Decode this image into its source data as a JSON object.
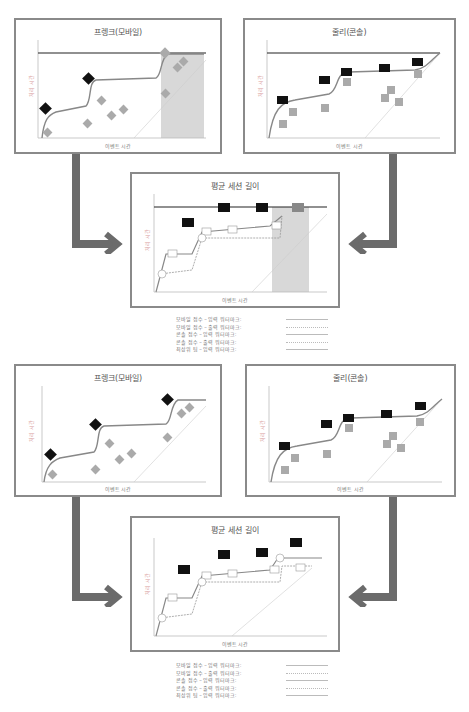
{
  "colors": {
    "panel_border": "#8a8a8a",
    "arrow": "#6b6b6b",
    "line": "#888888",
    "black_marker": "#111111",
    "grey_marker": "#9a9a9a",
    "shade": "#d8d8d8",
    "watermark": "#333333"
  },
  "sections": [
    {
      "mobile": {
        "title": "프렝크(모바일)",
        "xlabel": "이벤트 시간",
        "ylabel": "처리 시간",
        "markers_black": [
          "1.0",
          "1.2",
          "2.0"
        ],
        "markers_grey": [
          "1",
          "2",
          "3",
          "4",
          "5",
          "6",
          "7",
          "8"
        ]
      },
      "console": {
        "title": "줄리(콘솔)",
        "xlabel": "이벤트 시간",
        "ylabel": "처리 시간",
        "markers_black": [
          "1.0",
          "1.0",
          "1.0",
          "1.8",
          "1.0"
        ],
        "markers_grey": [
          "1",
          "2",
          "3",
          "4",
          "5",
          "6",
          "7",
          "8"
        ]
      },
      "average": {
        "title": "평균 세션 길이",
        "xlabel": "이벤트 시간",
        "ylabel": "처리 시간",
        "markers_black": [
          "1.2",
          "1.6",
          "1.6"
        ],
        "markers_grey": [
          "1.9"
        ]
      }
    },
    {
      "mobile": {
        "title": "프렝크(모바일)",
        "xlabel": "이벤트 시간",
        "ylabel": "처리 시간"
      },
      "console": {
        "title": "줄리(콘솔)",
        "xlabel": "이벤트 시간",
        "ylabel": "처리 시간"
      },
      "average": {
        "title": "평균 세션 길이",
        "xlabel": "이벤트 시간",
        "ylabel": "처리 시간",
        "markers_black": [
          "1.3",
          "1.6",
          "1.6",
          "1.8"
        ]
      }
    }
  ],
  "x_ticks": [
    "12:00",
    "12:01",
    "12:02",
    "12:03",
    "12:04",
    "12:05",
    "12:06",
    "12:07",
    "12:08",
    "12:09"
  ],
  "y_ticks": [
    "12:00",
    "12:02",
    "12:04",
    "12:06",
    "12:08",
    "12:10"
  ],
  "legend": [
    {
      "label": "모바일 점수 – 입력 워터마크:",
      "style": "solid"
    },
    {
      "label": "모바일 점수 – 출력 워터마크:",
      "style": "dotted"
    },
    {
      "label": "콘솔 점수 – 입력 워터마크:",
      "style": "solid"
    },
    {
      "label": "콘솔 점수 – 출력 워터마크:",
      "style": "dotted"
    },
    {
      "label": "최상위 팀 – 입력 워터마크:",
      "style": "solid"
    }
  ]
}
